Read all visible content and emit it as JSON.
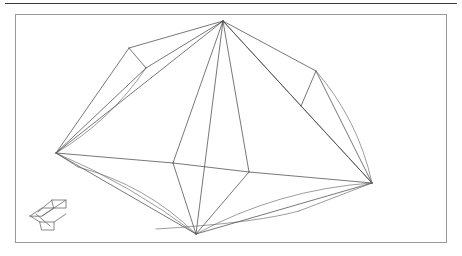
{
  "page": {
    "background_color": "#ffffff",
    "rule_color": "#3a3a3a",
    "frame_border_color": "#9a9a9a",
    "line_color": "#4b4b4b"
  },
  "viewport": {
    "name": "3d-wireframe-viewport",
    "x": 15,
    "y": 14,
    "width": 432,
    "height": 229
  },
  "figure": {
    "type": "wireframe-polyhedron",
    "vertices": {
      "apex": [
        207,
        6
      ],
      "left": [
        40,
        138
      ],
      "right": [
        356,
        168
      ],
      "bottom": [
        180,
        219
      ],
      "upper_left_facet_a": [
        113,
        33
      ],
      "upper_left_facet_b": [
        130,
        53
      ],
      "upper_left_facet_c": [
        96,
        61
      ],
      "upper_right_facet_a": [
        300,
        56
      ],
      "upper_right_facet_b": [
        285,
        91
      ],
      "upper_right_facet_c": [
        320,
        99
      ],
      "inner_left": [
        157,
        148
      ],
      "inner_right": [
        233,
        157
      ],
      "inner_top": [
        205,
        6
      ],
      "inner_bottom": [
        180,
        219
      ],
      "lower_left_arc_anchor": [
        62,
        152
      ],
      "lower_right_arc_anchor": [
        283,
        196
      ]
    },
    "edge_count": 26,
    "silhouette_arc_count": 4
  },
  "axis_gizmo": {
    "name": "orientation-axis-gizmo",
    "label": ""
  },
  "chart_data": {
    "type": "line",
    "title": "",
    "xlabel": "",
    "ylabel": "",
    "series": [
      {
        "name": "outer-silhouette",
        "points": [
          [
            207,
            6
          ],
          [
            40,
            138
          ],
          [
            180,
            219
          ],
          [
            356,
            168
          ],
          [
            207,
            6
          ]
        ]
      },
      {
        "name": "apex-spokes",
        "points": [
          [
            207,
            6
          ],
          [
            157,
            148
          ],
          [
            207,
            6
          ],
          [
            233,
            157
          ],
          [
            207,
            6
          ],
          [
            180,
            219
          ]
        ]
      },
      {
        "name": "inner-facet-ring",
        "points": [
          [
            157,
            148
          ],
          [
            233,
            157
          ],
          [
            180,
            219
          ],
          [
            157,
            148
          ]
        ]
      }
    ]
  }
}
